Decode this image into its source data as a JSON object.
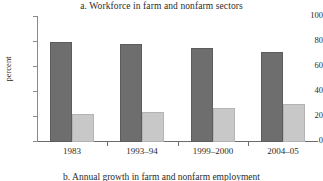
{
  "chart_data": {
    "type": "bar",
    "title": "a. Workforce in farm and nonfarm sectors",
    "xlabel": "",
    "ylabel": "percent",
    "categories": [
      "1983",
      "1993–94",
      "1999–2000",
      "2004–05"
    ],
    "series": [
      {
        "name": "farm",
        "color": "#6e6e6e",
        "values": [
          79.5,
          77.5,
          74.5,
          71.5
        ]
      },
      {
        "name": "nonfarm",
        "color": "#c8c8c8",
        "values": [
          21.5,
          23.5,
          26.0,
          29.5
        ]
      }
    ],
    "ylim": [
      0,
      100
    ],
    "yticks": [
      0,
      20,
      40,
      60,
      80,
      100
    ],
    "ytick_labels": [
      "0",
      "20",
      "40",
      "60",
      "80",
      "100"
    ],
    "grid": false,
    "legend": "none"
  },
  "next_panel": {
    "title": "b. Annual growth in farm and nonfarm employment"
  },
  "colors": {
    "bar_dark": "#6e6e6e",
    "bar_light": "#c8c8c8",
    "axis": "#6b6b6b",
    "text": "#2b2b2b",
    "background": "#ffffff"
  }
}
